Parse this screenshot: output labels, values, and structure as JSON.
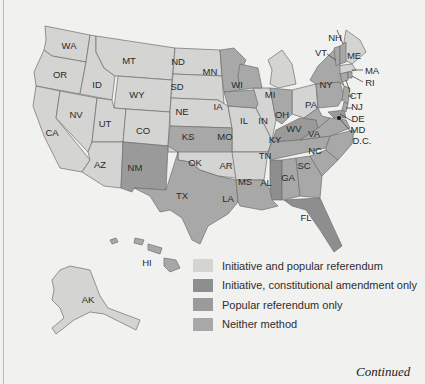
{
  "colors": {
    "initiative_and_referendum": "#d4d4d3",
    "initiative_constitutional_only": "#8e8e8e",
    "popular_referendum_only": "#9a9a9a",
    "neither_method": "#a8a8a8",
    "background": "#f1f1f0"
  },
  "legend": {
    "items": [
      {
        "label": "Initiative and popular referendum",
        "category": "initiative_and_referendum"
      },
      {
        "label": "Initiative, constitutional amendment only",
        "category": "initiative_constitutional_only"
      },
      {
        "label": "Popular referendum only",
        "category": "popular_referendum_only"
      },
      {
        "label": "Neither method",
        "category": "neither_method"
      }
    ]
  },
  "states": {
    "WA": "WA",
    "OR": "OR",
    "CA": "CA",
    "ID": "ID",
    "NV": "NV",
    "MT": "MT",
    "WY": "WY",
    "UT": "UT",
    "CO": "CO",
    "AZ": "AZ",
    "NM": "NM",
    "ND": "ND",
    "SD": "SD",
    "NE": "NE",
    "KS": "KS",
    "OK": "OK",
    "TX": "TX",
    "MN": "MN",
    "IA": "IA",
    "MO": "MO",
    "AR": "AR",
    "LA": "LA",
    "WI": "WI",
    "IL": "IL",
    "MI": "MI",
    "IN": "IN",
    "OH": "OH",
    "KY": "KY",
    "TN": "TN",
    "MS": "MS",
    "AL": "AL",
    "GA": "GA",
    "FL": "FL",
    "SC": "SC",
    "NC": "NC",
    "VA": "VA",
    "WV": "WV",
    "PA": "PA",
    "NY": "NY",
    "VT": "VT",
    "NH": "NH",
    "ME": "ME",
    "MA": "MA",
    "RI": "RI",
    "CT": "CT",
    "NJ": "NJ",
    "DE": "DE",
    "MD": "MD",
    "DC": "D.C.",
    "AK": "AK",
    "HI": "HI"
  },
  "footer": {
    "continued": "Continued"
  }
}
